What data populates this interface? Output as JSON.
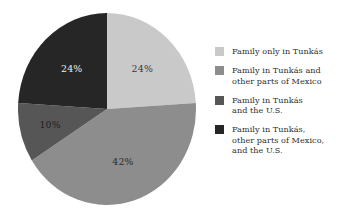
{
  "figure": {
    "background_color": "#ffffff",
    "text_color": "#2f2f2f"
  },
  "chart_data": {
    "type": "pie",
    "title": "",
    "subtitle": "",
    "xlabel": "",
    "ylabel": "",
    "grid": false,
    "legend_position": "right",
    "start_angle_deg": 0,
    "direction": "clockwise",
    "total_percent": 100,
    "categories": [
      "Family only in Tunkás",
      "Family in Tunkás and other parts of Mexico",
      "Family in Tunkás and the U.S.",
      "Family in Tunkás, other parts of Mexico, and the U.S."
    ],
    "values": [
      24,
      42,
      10,
      24
    ],
    "slices": [
      {
        "label": "Family only in Tunkás",
        "value": 24,
        "data_label": "24%",
        "color": "#c9c9c9",
        "label_color": "#3a3a3a",
        "start_angle_deg": 0,
        "end_angle_deg": 86.4
      },
      {
        "label": "Family in Tunkás and other parts of Mexico",
        "value": 42,
        "data_label": "42%",
        "color": "#8d8d8d",
        "label_color": "#2b2b2b",
        "start_angle_deg": 86.4,
        "end_angle_deg": 237.6
      },
      {
        "label": "Family in Tunkás and the U.S.",
        "value": 10,
        "data_label": "10%",
        "color": "#565656",
        "label_color": "#1d1d1d",
        "start_angle_deg": 237.6,
        "end_angle_deg": 273.6
      },
      {
        "label": "Family in Tunkás, other parts of Mexico, and the U.S.",
        "value": 24,
        "data_label": "24%",
        "color": "#262626",
        "label_color": "#ededed",
        "start_angle_deg": 273.6,
        "end_angle_deg": 360
      }
    ]
  },
  "legend": {
    "items": [
      {
        "swatch_color": "#c9c9c9",
        "label": "Family only in Tunkás"
      },
      {
        "swatch_color": "#8d8d8d",
        "label": "Family in Tunkás and\nother parts of Mexico"
      },
      {
        "swatch_color": "#565656",
        "label": "Family in Tunkás\nand the U.S."
      },
      {
        "swatch_color": "#262626",
        "label": "Family in Tunkás,\nother parts of Mexico,\nand the U.S."
      }
    ]
  }
}
